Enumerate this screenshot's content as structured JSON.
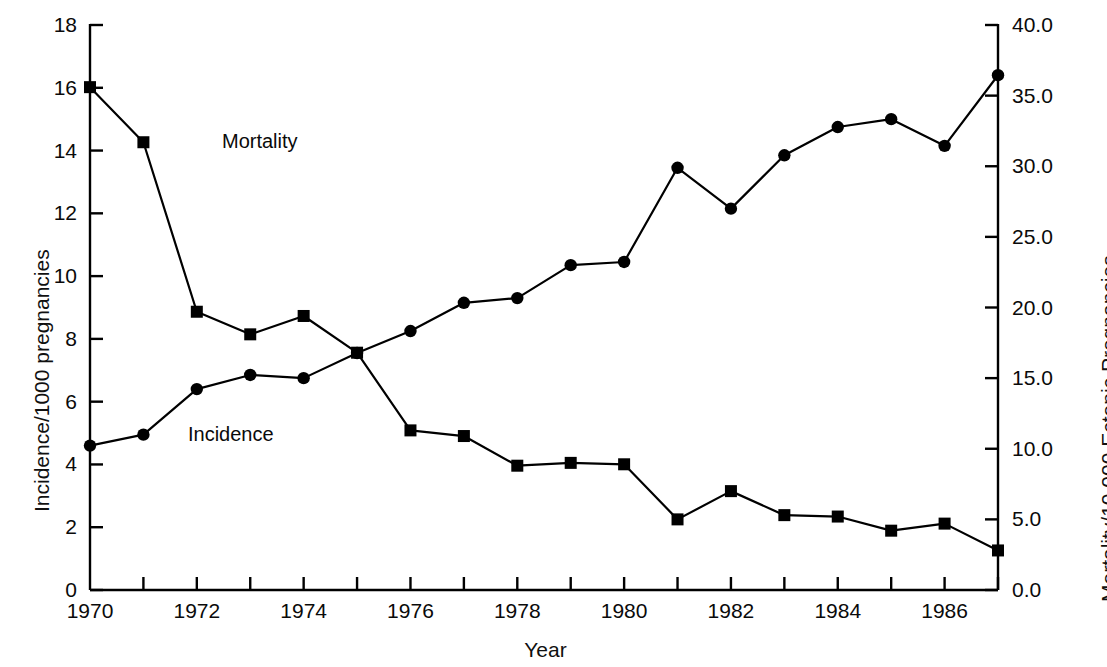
{
  "axes": {
    "y_left_title": "Incidence/1000 pregnancies",
    "y_right_title": "Mortality/10,000 Ectopic Pregnancies",
    "x_title": "Year"
  },
  "labels": {
    "mortality": "Mortality",
    "incidence": "Incidence"
  },
  "chart_data": {
    "type": "line",
    "title": "",
    "xlabel": "Year",
    "ylabel": "Incidence/1000 pregnancies",
    "y2label": "Mortality/10,000 Ectopic Pregnancies",
    "grid": false,
    "legend": "inline-annotations",
    "xlim": [
      1970,
      1987
    ],
    "ylim": [
      0,
      18
    ],
    "y2lim": [
      0.0,
      40.0
    ],
    "x": [
      1970,
      1971,
      1972,
      1973,
      1974,
      1975,
      1976,
      1977,
      1978,
      1979,
      1980,
      1981,
      1982,
      1983,
      1984,
      1985,
      1986,
      1987
    ],
    "xticks": [
      1970,
      1971,
      1972,
      1973,
      1974,
      1975,
      1976,
      1977,
      1978,
      1979,
      1980,
      1981,
      1982,
      1983,
      1984,
      1985,
      1986,
      1987
    ],
    "xticklabels": [
      "1970",
      "",
      "1972",
      "",
      "1974",
      "",
      "1976",
      "",
      "1978",
      "",
      "1980",
      "",
      "1982",
      "",
      "1984",
      "",
      "1986",
      ""
    ],
    "yticks": [
      0,
      2,
      4,
      6,
      8,
      10,
      12,
      14,
      16,
      18
    ],
    "yticklabels": [
      "0",
      "2",
      "4",
      "6",
      "8",
      "10",
      "12",
      "14",
      "16",
      "18"
    ],
    "y2ticks": [
      0.0,
      5.0,
      10.0,
      15.0,
      20.0,
      25.0,
      30.0,
      35.0,
      40.0
    ],
    "y2ticklabels": [
      "0.0",
      "5.0",
      "10.0",
      "15.0",
      "20.0",
      "25.0",
      "30.0",
      "35.0",
      "40.0"
    ],
    "series": [
      {
        "name": "Incidence",
        "axis": "left",
        "marker": "circle",
        "color": "#000000",
        "units": "per 1000 pregnancies",
        "values": [
          4.6,
          4.95,
          6.4,
          6.85,
          6.75,
          7.55,
          8.25,
          9.15,
          9.3,
          10.35,
          10.45,
          13.45,
          12.15,
          13.85,
          14.75,
          15.0,
          14.15,
          16.4
        ]
      },
      {
        "name": "Mortality",
        "axis": "right",
        "marker": "square",
        "color": "#000000",
        "units": "per 10,000 ectopic pregnancies",
        "values": [
          35.6,
          31.7,
          19.7,
          18.1,
          19.4,
          16.8,
          11.3,
          10.9,
          8.8,
          9.0,
          8.9,
          5.0,
          7.0,
          5.3,
          5.2,
          4.2,
          4.7,
          2.8
        ]
      }
    ]
  }
}
